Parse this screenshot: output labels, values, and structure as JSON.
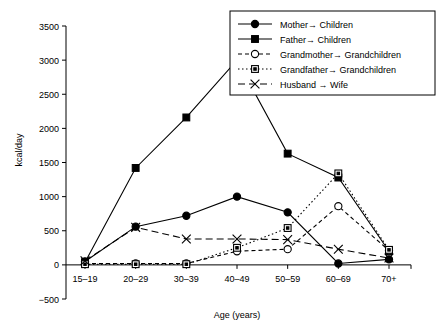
{
  "chart_data": {
    "type": "line",
    "title": "",
    "xlabel": "Age (years)",
    "ylabel": "kcal/day",
    "categories": [
      "15–19",
      "20–29",
      "30–39",
      "40–49",
      "50–59",
      "60–69",
      "70+"
    ],
    "ylim": [
      -500,
      3500
    ],
    "yticks": [
      -500,
      0,
      500,
      1000,
      1500,
      2000,
      2500,
      3000,
      3500
    ],
    "yticklabels": [
      "−500",
      "0",
      "500",
      "1000",
      "1500",
      "2000",
      "2500",
      "3000",
      "3500"
    ],
    "grid": false,
    "legend_position": "top-right",
    "series": [
      {
        "name": "Mother→ Children",
        "marker": "filled-circle",
        "linestyle": "solid",
        "color": "#000000",
        "values": [
          50,
          560,
          720,
          1000,
          770,
          20,
          80
        ]
      },
      {
        "name": "Father→ Children",
        "marker": "filled-square",
        "linestyle": "solid",
        "color": "#000000",
        "values": [
          40,
          1420,
          2160,
          3000,
          1630,
          1280,
          200
        ]
      },
      {
        "name": "Grandmother→ Grandchildren",
        "marker": "open-circle",
        "linestyle": "dashed",
        "color": "#000000",
        "values": [
          20,
          20,
          20,
          200,
          230,
          860,
          210
        ]
      },
      {
        "name": "Grandfather→ Grandchildren",
        "marker": "open-square",
        "linestyle": "dotted",
        "color": "#000000",
        "values": [
          10,
          10,
          10,
          250,
          540,
          1340,
          220
        ]
      },
      {
        "name": "Husband → Wife",
        "marker": "cross-x",
        "linestyle": "long-dash",
        "color": "#000000",
        "values": [
          60,
          550,
          380,
          380,
          370,
          230,
          100
        ]
      }
    ]
  },
  "legend": {
    "items": [
      {
        "label": "Mother→ Children"
      },
      {
        "label": "Father→ Children"
      },
      {
        "label": "Grandmother→ Grandchildren"
      },
      {
        "label": "Grandfather→ Grandchildren"
      },
      {
        "label": "Husband → Wife"
      }
    ]
  }
}
